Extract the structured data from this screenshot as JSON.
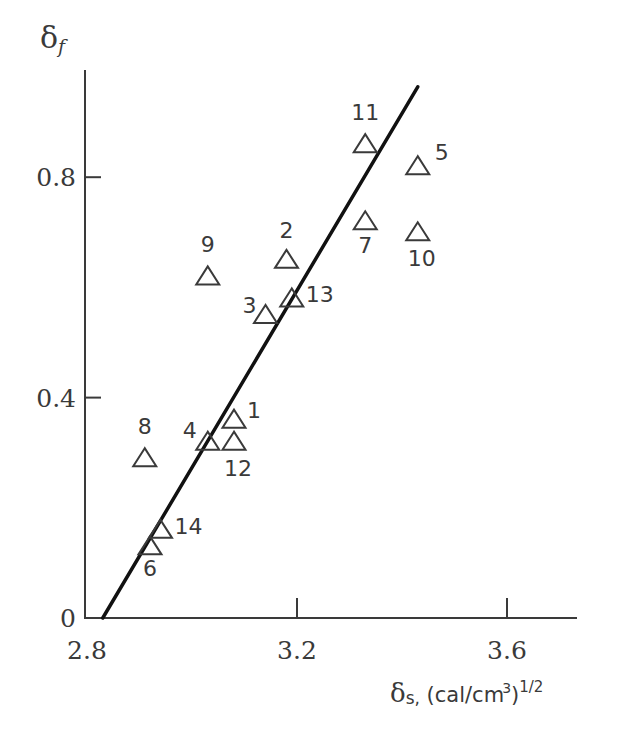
{
  "chart_data": {
    "type": "scatter",
    "title": "",
    "xlabel": "δs, (cal/cm³)^1/2",
    "ylabel": "δf",
    "xlim": [
      2.8,
      3.74
    ],
    "ylim": [
      0,
      0.99
    ],
    "x_ticks": [
      2.8,
      3.2,
      3.6
    ],
    "x_tick_labels": [
      "2.8",
      "3.2",
      "3.6"
    ],
    "y_ticks": [
      0,
      0.4,
      0.8
    ],
    "y_tick_labels": [
      "0",
      "0.4",
      "0.8"
    ],
    "grid": false,
    "legend": null,
    "marker": "open-triangle",
    "series": [
      {
        "name": "samples",
        "points": [
          {
            "label": "1",
            "x": 3.08,
            "y": 0.36
          },
          {
            "label": "2",
            "x": 3.18,
            "y": 0.65
          },
          {
            "label": "3",
            "x": 3.14,
            "y": 0.55
          },
          {
            "label": "4",
            "x": 3.03,
            "y": 0.32
          },
          {
            "label": "5",
            "x": 3.43,
            "y": 0.82
          },
          {
            "label": "6",
            "x": 2.92,
            "y": 0.13
          },
          {
            "label": "7",
            "x": 3.33,
            "y": 0.72
          },
          {
            "label": "8",
            "x": 2.91,
            "y": 0.29
          },
          {
            "label": "9",
            "x": 3.03,
            "y": 0.62
          },
          {
            "label": "10",
            "x": 3.43,
            "y": 0.7
          },
          {
            "label": "11",
            "x": 3.33,
            "y": 0.86
          },
          {
            "label": "12",
            "x": 3.08,
            "y": 0.32
          },
          {
            "label": "13",
            "x": 3.19,
            "y": 0.58
          },
          {
            "label": "14",
            "x": 2.94,
            "y": 0.16
          }
        ]
      }
    ],
    "fit_line": {
      "x": [
        2.83,
        3.43
      ],
      "y": [
        0.0,
        0.964
      ]
    },
    "point_label_offsets": {
      "1": [
        20,
        -2
      ],
      "2": [
        0,
        -22
      ],
      "3": [
        -16,
        -2
      ],
      "4": [
        -18,
        -4
      ],
      "5": [
        24,
        -6
      ],
      "6": [
        0,
        30
      ],
      "7": [
        0,
        32
      ],
      "8": [
        0,
        -24
      ],
      "9": [
        0,
        -24
      ],
      "10": [
        4,
        34
      ],
      "11": [
        0,
        -24
      ],
      "12": [
        4,
        34
      ],
      "13": [
        28,
        4
      ],
      "14": [
        28,
        4
      ]
    }
  },
  "axis": {
    "y_title_main": "δ",
    "y_title_sub": "f",
    "x_title_main": "δ",
    "x_title_sub": "s,",
    "x_title_units": " (cal/cm",
    "x_title_cube": "3",
    "x_title_close": ")",
    "x_title_exp": "1/2"
  },
  "colors": {
    "ink": "#3a3a3a",
    "line": "#111111",
    "background": "#ffffff"
  }
}
